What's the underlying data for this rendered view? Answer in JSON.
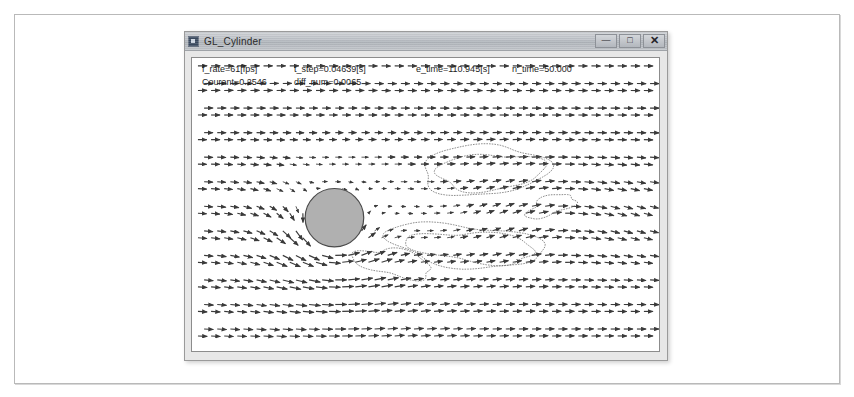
{
  "window": {
    "title": "GL_Cylinder",
    "icon": "app-icon",
    "controls": [
      {
        "name": "minimize",
        "glyph": "—"
      },
      {
        "name": "maximize",
        "glyph": "□"
      },
      {
        "name": "close",
        "glyph": "✕"
      }
    ]
  },
  "hud": {
    "row1": [
      "f_rate=61[fps]",
      "t_step=0.04639[s]",
      "e_time=110.945[s]",
      "n_time=50.000"
    ],
    "row2": [
      "Courant=0.2546",
      "diff_num=0.0065"
    ]
  },
  "simulation": {
    "type": "vector-field-flow-past-cylinder",
    "cylinder": {
      "cx": 0.305,
      "cy": 0.545,
      "r": 0.083,
      "fill": "#b0b0b0",
      "stroke": "#4a4a4a"
    },
    "vector_color": "#3a3a3a",
    "contour_color": "#5a5a5a",
    "background": "#ffffff"
  }
}
